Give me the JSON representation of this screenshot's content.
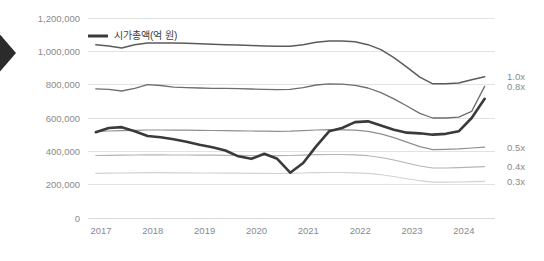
{
  "legend": {
    "entries": [
      {
        "label": "시가총액(억 원)",
        "color": "#3a3a3a",
        "name": "market-cap"
      }
    ]
  },
  "decoration": {
    "left_arrow_name": "left-chevron-arrow",
    "left_arrow_color": "#2b2b2b"
  },
  "axis": {
    "y_ticks": [
      "0",
      "200,000",
      "400,000",
      "600,000",
      "800,000",
      "1,000,000",
      "1,200,000"
    ],
    "x_ticks": [
      "2017",
      "2018",
      "2019",
      "2020",
      "2021",
      "2022",
      "2023",
      "2024"
    ],
    "right_labels": [
      "1.0x",
      "0.8x",
      "0.5x",
      "0.4x",
      "0.3x"
    ]
  },
  "chart_data": {
    "type": "line",
    "title": "",
    "xlabel": "",
    "ylabel": "",
    "ylim": [
      0,
      1200000
    ],
    "xlim": [
      2016.75,
      2024.6
    ],
    "grid": true,
    "legend_position": "top-left",
    "y_tick_values": [
      0,
      200000,
      400000,
      600000,
      800000,
      1000000,
      1200000
    ],
    "x_tick_values": [
      2017,
      2018,
      2019,
      2020,
      2021,
      2022,
      2023,
      2024
    ],
    "right_axis_annotations": [
      {
        "label": "1.0x",
        "value": 1000000
      },
      {
        "label": "0.8x",
        "value": 800000
      },
      {
        "label": "0.5x",
        "value": 500000
      },
      {
        "label": "0.4x",
        "value": 400000
      },
      {
        "label": "0.3x",
        "value": 300000
      }
    ],
    "x": [
      2016.9,
      2017.15,
      2017.4,
      2017.65,
      2017.9,
      2018.15,
      2018.4,
      2018.65,
      2018.9,
      2019.15,
      2019.4,
      2019.65,
      2019.9,
      2020.15,
      2020.4,
      2020.65,
      2020.9,
      2021.15,
      2021.4,
      2021.65,
      2021.9,
      2022.15,
      2022.4,
      2022.65,
      2022.9,
      2023.15,
      2023.4,
      2023.65,
      2023.9,
      2024.15,
      2024.4
    ],
    "series": [
      {
        "name": "시가총액(억 원)",
        "label": "시가총액(억 원)",
        "color": "#3a3a3a",
        "width": 2.6,
        "values": [
          515000,
          540000,
          545000,
          520000,
          492000,
          485000,
          472000,
          458000,
          440000,
          425000,
          405000,
          370000,
          355000,
          385000,
          355000,
          272000,
          330000,
          430000,
          520000,
          540000,
          575000,
          580000,
          555000,
          530000,
          512000,
          508000,
          500000,
          505000,
          520000,
          600000,
          715000
        ]
      },
      {
        "name": "1.0x-band",
        "label": "1.0x",
        "color": "#5b5b5b",
        "width": 1.5,
        "values": [
          1040000,
          1032000,
          1020000,
          1040000,
          1050000,
          1050000,
          1050000,
          1048000,
          1045000,
          1042000,
          1040000,
          1038000,
          1035000,
          1032000,
          1030000,
          1030000,
          1040000,
          1055000,
          1062000,
          1062000,
          1058000,
          1040000,
          1010000,
          962000,
          905000,
          845000,
          805000,
          805000,
          810000,
          830000,
          848000
        ]
      },
      {
        "name": "0.8x-band",
        "label": "0.8x",
        "color": "#6e6e6e",
        "width": 1.3,
        "values": [
          775000,
          772000,
          762000,
          778000,
          800000,
          795000,
          785000,
          782000,
          780000,
          778000,
          778000,
          776000,
          774000,
          772000,
          770000,
          772000,
          782000,
          798000,
          805000,
          803000,
          796000,
          780000,
          752000,
          715000,
          672000,
          628000,
          600000,
          600000,
          605000,
          640000,
          790000
        ]
      },
      {
        "name": "0.5x-band",
        "label": "0.5x",
        "color": "#8f8f8f",
        "width": 1.2,
        "values": [
          520000,
          522000,
          524000,
          526000,
          528000,
          528000,
          527000,
          527000,
          526000,
          525000,
          524000,
          523000,
          522000,
          521000,
          520000,
          521000,
          524000,
          528000,
          530000,
          529000,
          527000,
          520000,
          505000,
          482000,
          455000,
          428000,
          410000,
          412000,
          415000,
          420000,
          425000
        ]
      },
      {
        "name": "0.4x-band",
        "label": "0.4x",
        "color": "#b4b4b4",
        "width": 1.1,
        "values": [
          375000,
          376000,
          377000,
          378000,
          379000,
          379000,
          378000,
          378000,
          377000,
          377000,
          376000,
          376000,
          375000,
          375000,
          374000,
          375000,
          377000,
          380000,
          381000,
          381000,
          379000,
          374000,
          363000,
          348000,
          330000,
          312000,
          300000,
          300000,
          302000,
          305000,
          308000
        ]
      },
      {
        "name": "0.3x-band",
        "label": "0.3x",
        "color": "#d2d2d2",
        "width": 1.1,
        "values": [
          268000,
          269000,
          270000,
          271000,
          272000,
          272000,
          271000,
          271000,
          270000,
          270000,
          269000,
          269000,
          268000,
          268000,
          267000,
          268000,
          270000,
          272000,
          273000,
          273000,
          271000,
          268000,
          260000,
          249000,
          236000,
          224000,
          215000,
          215000,
          216000,
          218000,
          220000
        ]
      }
    ]
  }
}
